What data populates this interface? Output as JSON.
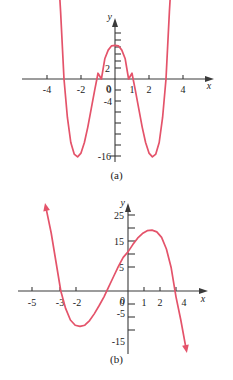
{
  "figure": {
    "background_color": "#ffffff",
    "curve_color": "#e4536a",
    "axis_color": "#3a3a3a",
    "text_color": "#1a1a1a",
    "panels": [
      {
        "id": "a",
        "caption": "(a)"
      },
      {
        "id": "b",
        "caption": "(b)"
      }
    ]
  },
  "chart_data": [
    {
      "type": "line",
      "title": "(a)",
      "xlabel": "x",
      "ylabel": "y",
      "xlim": [
        -4.6,
        4.6
      ],
      "ylim": [
        -19,
        9
      ],
      "grid": false,
      "legend": "none",
      "x_tick_labels": [
        "-4",
        "-2",
        "0",
        "1",
        "2",
        "4"
      ],
      "x_ticks": [
        -4,
        -2,
        0,
        1,
        2,
        4
      ],
      "y_tick_labels": [
        "2",
        "0",
        "-4",
        "-16"
      ],
      "y_ticks": [
        2,
        0,
        -4,
        -16
      ],
      "y_minor_ticks": [
        8,
        6,
        4,
        -2,
        -6,
        -8,
        -10,
        -12,
        -14,
        -18
      ],
      "series": [
        {
          "name": "quartic",
          "description": "W-shaped quartic with local max near x=0 at y=7, minima near x=-2.2 and x=2.2 at y=-16, x-intercepts near -3, -0.8, 0.8, 3",
          "x": [
            -3.35,
            -3.2,
            -3.0,
            -2.8,
            -2.6,
            -2.4,
            -2.2,
            -2.0,
            -1.8,
            -1.6,
            -1.4,
            -1.2,
            -1.0,
            -0.8,
            -0.6,
            -0.4,
            -0.2,
            0.0,
            0.2,
            0.4,
            0.6,
            0.8,
            1.0,
            1.2,
            1.4,
            1.6,
            1.8,
            2.0,
            2.2,
            2.4,
            2.6,
            2.8,
            3.0,
            3.2,
            3.35
          ],
          "y": [
            23.0,
            14.0,
            0.0,
            -8.0,
            -13.2,
            -15.6,
            -16.2,
            -15.4,
            -13.2,
            -10.0,
            -6.2,
            -2.4,
            1.2,
            0.0,
            4.2,
            6.0,
            6.9,
            7.0,
            6.9,
            6.0,
            4.2,
            0.0,
            1.2,
            -2.4,
            -6.2,
            -10.0,
            -13.2,
            -15.4,
            -16.2,
            -15.6,
            -13.2,
            -8.0,
            0.0,
            14.0,
            23.0
          ]
        }
      ],
      "arrows": [
        "up-left-end",
        "up-right-end"
      ]
    },
    {
      "type": "line",
      "title": "(b)",
      "xlabel": "x",
      "ylabel": "y",
      "xlim": [
        -5.8,
        4.8
      ],
      "ylim": [
        -22,
        32
      ],
      "grid": false,
      "legend": "none",
      "x_tick_labels": [
        "-5",
        "-3",
        "-2",
        "0",
        "1",
        "2",
        "4"
      ],
      "x_ticks": [
        -5,
        -3,
        -2,
        0,
        1,
        2,
        4
      ],
      "y_tick_labels": [
        "25",
        "15",
        "5",
        "0",
        "-5",
        "-15"
      ],
      "y_ticks": [
        25,
        15,
        5,
        0,
        -5,
        -15
      ],
      "y_minor_ticks": [
        20,
        10,
        -10,
        -20
      ],
      "series": [
        {
          "name": "cubic",
          "description": "Negative-leading cubic: rises from lower-left arrow up, local min near x=-2.9 at y=-12, local max near x=1.4 at y=21, x-intercepts near -4.2, -0.3, 2.8",
          "x": [
            -5.1,
            -4.8,
            -4.5,
            -4.2,
            -3.9,
            -3.6,
            -3.3,
            -3.0,
            -2.7,
            -2.4,
            -2.1,
            -1.8,
            -1.5,
            -1.2,
            -0.9,
            -0.6,
            -0.3,
            0.0,
            0.3,
            0.6,
            0.9,
            1.2,
            1.5,
            1.8,
            2.1,
            2.4,
            2.7,
            3.0,
            3.3,
            3.6
          ],
          "y": [
            28.0,
            20.0,
            10.0,
            0.0,
            -6.0,
            -10.0,
            -11.8,
            -12.2,
            -11.8,
            -10.2,
            -7.8,
            -5.0,
            -2.0,
            1.5,
            5.0,
            8.5,
            11.6,
            13.5,
            16.0,
            18.2,
            19.8,
            20.8,
            21.0,
            20.4,
            18.5,
            14.5,
            8.0,
            -2.0,
            -10.0,
            -19.0
          ]
        }
      ],
      "arrows": [
        "up-left-end",
        "down-right-end"
      ]
    }
  ]
}
